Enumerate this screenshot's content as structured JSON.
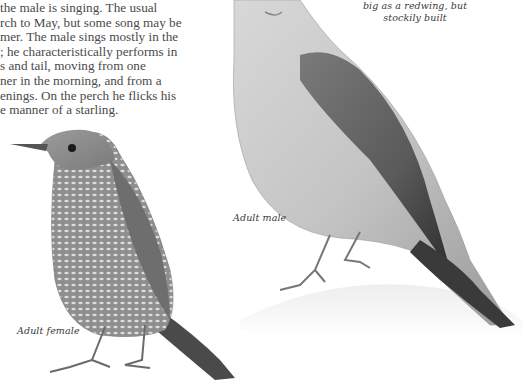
{
  "page": {
    "type": "field-guide-page",
    "background_color": "#ffffff",
    "text_color": "#4a4a4a"
  },
  "body_text": {
    "lines": [
      "the male is singing. The usual",
      "rch to May, but some song may be",
      "mer. The male sings mostly in the",
      "; he characteristically performs in",
      "s and tail, moving from one",
      "ner in the morning, and from a",
      "enings. On the perch he flicks his",
      "e manner of a starling."
    ]
  },
  "captions": {
    "size_note_line1": "big as a redwing, but",
    "size_note_line2": "stockily built",
    "adult_male": "Adult male",
    "adult_female": "Adult female"
  },
  "illustrations": [
    {
      "name": "adult-female-bird",
      "description": "thrush-like bird with heavily scaled/barred underparts, facing left"
    },
    {
      "name": "adult-male-bird",
      "description": "thrush-like bird with plain breast and darker wing, perched on rock, facing up-left"
    }
  ]
}
